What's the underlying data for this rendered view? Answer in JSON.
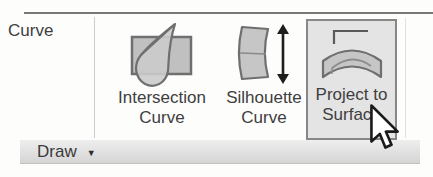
{
  "ribbon": {
    "group_label": "Curve",
    "buttons": [
      {
        "id": "intersection-curve",
        "label_line1": "Intersection",
        "label_line2": "Curve",
        "icon": "intersection-curve-icon",
        "state": "normal"
      },
      {
        "id": "silhouette-curve",
        "label_line1": "Silhouette",
        "label_line2": "Curve",
        "icon": "silhouette-curve-icon",
        "state": "normal"
      },
      {
        "id": "project-to-surface",
        "label_line1": "Project to",
        "label_line2": "Surface",
        "icon": "project-to-surface-icon",
        "state": "hovered"
      }
    ],
    "panel_footer": {
      "label": "Draw",
      "dropdown_glyph": "▼"
    }
  },
  "cursor": {
    "type": "arrow-pointer",
    "over": "project-to-surface-button"
  },
  "colors": {
    "background": "#fdfdfc",
    "top_rule": "#606060",
    "separator": "#cccccc",
    "text": "#3e3e3e",
    "hover_fill": "#e4e4e4",
    "hover_border": "#878787",
    "icon_fill": "#c6c6c6",
    "icon_stroke": "#6f6f6f",
    "footer_bar_top": "#eeeeee",
    "footer_bar_bottom": "#d5d5d5",
    "arrow_black": "#1d1d1d"
  }
}
